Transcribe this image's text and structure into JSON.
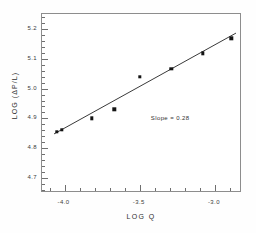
{
  "figure": {
    "background_color": "#fefefe",
    "frame_color": "#8d8d8d",
    "ink_color": "#141414"
  },
  "annotations": {
    "slope_label": "Slope = 0.28"
  },
  "chart_data": {
    "type": "scatter",
    "title": "",
    "subtitle": "",
    "xlabel": "LOG  Q",
    "ylabel": "LOG (ΔP/L)",
    "xlim": [
      -4.15,
      -2.82
    ],
    "ylim": [
      4.65,
      5.25
    ],
    "grid": false,
    "legend": "none",
    "x_major_ticks": [
      -4.0,
      -3.5,
      -3.0
    ],
    "x_major_tick_labels": [
      "-4.0",
      "-3.5",
      "-3.0"
    ],
    "x_minor_tick_step": 0.1,
    "y_major_ticks": [
      4.7,
      4.8,
      4.9,
      5.0,
      5.1,
      5.2
    ],
    "y_major_tick_labels": [
      "4.7",
      "4.8",
      "4.9",
      "5.0",
      "5.1",
      "5.2"
    ],
    "y_minor_tick_step": 0.02,
    "marker": "filled-square",
    "points": [
      {
        "x": -4.05,
        "y": 4.855
      },
      {
        "x": -4.02,
        "y": 4.862
      },
      {
        "x": -3.82,
        "y": 4.9
      },
      {
        "x": -3.67,
        "y": 4.93
      },
      {
        "x": -3.5,
        "y": 5.04
      },
      {
        "x": -3.29,
        "y": 5.067
      },
      {
        "x": -3.08,
        "y": 5.118
      },
      {
        "x": -2.89,
        "y": 5.168
      }
    ],
    "fit_line": {
      "slope": 0.28,
      "label": "Slope = 0.28",
      "x_start": -4.07,
      "y_start": 4.848,
      "x_end": -2.86,
      "y_end": 5.186
    },
    "annotation_position": {
      "x": -3.42,
      "y": 4.895
    }
  }
}
